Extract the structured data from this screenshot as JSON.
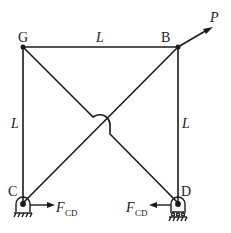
{
  "diagram": {
    "nodes": [
      {
        "id": "G",
        "label": "G"
      },
      {
        "id": "B",
        "label": "B"
      },
      {
        "id": "C",
        "label": "C"
      },
      {
        "id": "D",
        "label": "D"
      }
    ],
    "members": [
      {
        "from": "G",
        "to": "B",
        "length_label": "L"
      },
      {
        "from": "G",
        "to": "C",
        "length_label": "L"
      },
      {
        "from": "B",
        "to": "D",
        "length_label": "L"
      },
      {
        "from": "G",
        "to": "D",
        "length_label": ""
      },
      {
        "from": "B",
        "to": "C",
        "length_label": ""
      }
    ],
    "labels": {
      "top_length": "L",
      "left_length": "L",
      "right_length": "L",
      "load": "P",
      "force_main": "F",
      "force_sub": "CD"
    },
    "supports": [
      {
        "node": "C",
        "type": "pin"
      },
      {
        "node": "D",
        "type": "roller"
      }
    ],
    "line_color": "#1a1a1a"
  }
}
